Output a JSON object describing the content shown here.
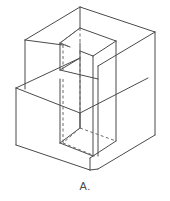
{
  "figure": {
    "label": "A.",
    "caption_label": "A.",
    "type": "isometric-wireframe-solid",
    "colors": {
      "background": "#ffffff",
      "visible_edge": "#4b4b4b",
      "hidden_edge": "#6b6b6b",
      "label_text": "#4a4a4a"
    },
    "line_styles": {
      "visible": "solid",
      "hidden": "dashed"
    },
    "geometry": {
      "projection": "isometric",
      "block": {
        "name": "main-block",
        "top_face": [
          [
            80,
            7
          ],
          [
            155,
            32
          ],
          [
            90,
            70
          ],
          [
            25,
            40
          ]
        ],
        "bottom_front_vertex": [
          90,
          170
        ],
        "left_bottom_vertex": [
          16,
          145
        ],
        "right_bottom_vertex": [
          155,
          135
        ],
        "height_px": 100
      },
      "step": {
        "name": "step-notch",
        "top_face": [
          [
            16,
            88
          ],
          [
            82,
            113
          ],
          [
            148,
            78
          ],
          [
            82,
            58
          ]
        ],
        "left_front_height_px": 57
      },
      "prism": {
        "name": "through-prism",
        "top_face": [
          [
            80,
            28
          ],
          [
            116,
            41
          ],
          [
            93,
            56
          ],
          [
            60,
            43
          ]
        ],
        "bottom_face": [
          [
            80,
            128
          ],
          [
            116,
            141
          ],
          [
            93,
            156
          ],
          [
            60,
            143
          ]
        ],
        "height_px": 100
      }
    }
  }
}
